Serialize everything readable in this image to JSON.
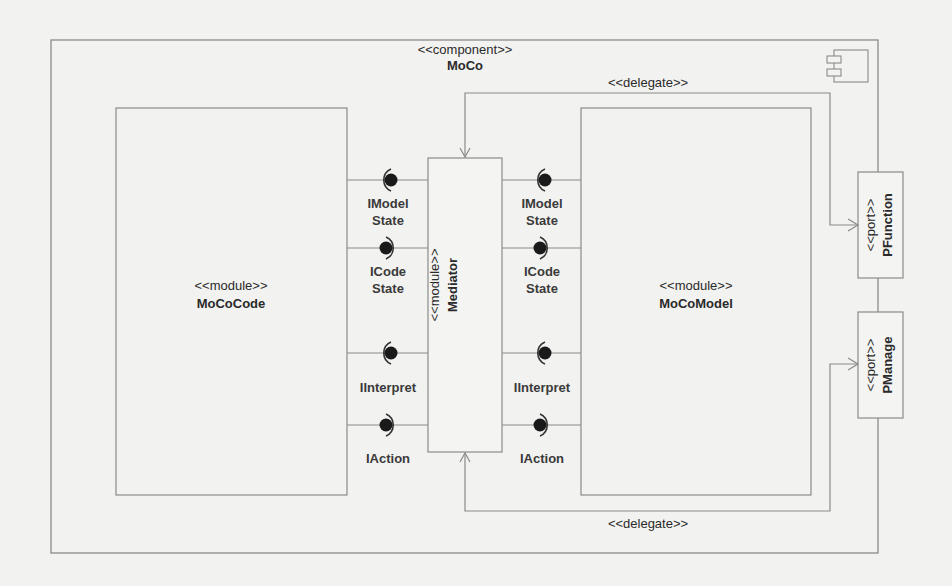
{
  "diagram": {
    "type": "uml-component-diagram",
    "component": {
      "stereotype": "<<component>>",
      "name": "MoCo",
      "icon": "uml-component-icon"
    },
    "modules": [
      {
        "id": "code",
        "stereotype": "<<module>>",
        "name": "MoCoCode"
      },
      {
        "id": "mediator",
        "stereotype": "<<module>>",
        "name": "Mediator"
      },
      {
        "id": "model",
        "stereotype": "<<module>>",
        "name": "MoCoModel"
      }
    ],
    "ports": [
      {
        "id": "pfunction",
        "stereotype": "<<port>>",
        "name": "PFunction"
      },
      {
        "id": "pmanage",
        "stereotype": "<<port>>",
        "name": "PManage"
      }
    ],
    "interfaces_left": [
      {
        "label_line1": "IModel",
        "label_line2": "State",
        "kind": "required"
      },
      {
        "label_line1": "ICode",
        "label_line2": "State",
        "kind": "provided"
      },
      {
        "label_line1": "IInterpret",
        "label_line2": "",
        "kind": "required"
      },
      {
        "label_line1": "IAction",
        "label_line2": "",
        "kind": "provided"
      }
    ],
    "interfaces_right": [
      {
        "label_line1": "IModel",
        "label_line2": "State",
        "kind": "required"
      },
      {
        "label_line1": "ICode",
        "label_line2": "State",
        "kind": "provided"
      },
      {
        "label_line1": "IInterpret",
        "label_line2": "",
        "kind": "required"
      },
      {
        "label_line1": "IAction",
        "label_line2": "",
        "kind": "provided"
      }
    ],
    "connectors": [
      {
        "label": "<<delegate>>",
        "from": "PFunction",
        "to": "Mediator",
        "position": "top"
      },
      {
        "label": "<<delegate>>",
        "from": "PManage",
        "to": "Mediator",
        "position": "bottom"
      }
    ],
    "colors": {
      "background": "#f2f2f0",
      "line": "#8a8a8a",
      "text": "#2a2a2a",
      "ball": "#1a1a1a"
    }
  }
}
